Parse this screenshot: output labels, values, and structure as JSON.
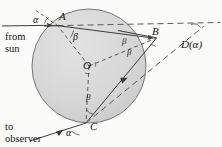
{
  "figure": {
    "type": "optics-geometry-diagram"
  },
  "colors": {
    "background": "#fbfbfa",
    "drop_fill": "#d8d8d8",
    "drop_stroke": "#6f6f6f",
    "ray_stroke": "#3c3c3c",
    "dashed_stroke": "#4a4a4a",
    "text": "#151515"
  },
  "points": {
    "A": {
      "label": "A",
      "x": 57,
      "y": 20
    },
    "B": {
      "label": "B",
      "x": 157,
      "y": 38
    },
    "C": {
      "label": "C",
      "x": 86,
      "y": 123
    },
    "O": {
      "label": "O",
      "x": 89,
      "y": 66
    }
  },
  "angles": {
    "alpha_incident": "α",
    "alpha_exit": "α",
    "beta_refraction_A": "β",
    "beta_upper_B": "β",
    "beta_lower_B": "β",
    "beta_C": "β"
  },
  "captions": {
    "from_sun_line1": "from",
    "from_sun_line2": "sun",
    "to_observer_line1": "to",
    "to_observer_line2": "observer"
  },
  "deviation": {
    "label": "D(α)"
  },
  "geometry": {
    "drop_center_x": 89,
    "drop_center_y": 66,
    "drop_radius": 57,
    "incoming_ray_y": 26,
    "incoming_ray_start_x": 2,
    "extension_ray_end_x": 220,
    "exit_ray_end_x": 4,
    "exit_ray_end_y": 143
  },
  "arrows": {
    "incoming": "arrowhead-right",
    "chord_AB": "arrowhead-right",
    "chord_BC": "arrowhead-down-left",
    "exit_CD": "arrowhead-down-left"
  }
}
